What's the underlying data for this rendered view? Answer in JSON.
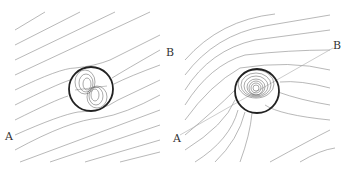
{
  "figure": {
    "panels": [
      {
        "id": "left",
        "labels": {
          "A": "A",
          "B": "B"
        },
        "circle": {
          "cx": 91,
          "cy": 89,
          "r": 22
        },
        "description": "Uniform diagonal field lines deflected around a circular inclusion with dipole-like contours inside"
      },
      {
        "id": "right",
        "labels": {
          "A": "A",
          "B": "B"
        },
        "circle": {
          "cx": 257,
          "cy": 91,
          "r": 22
        },
        "description": "Curved field lines wrapping around circular inclusion with concentric contours inside; dashed line from A to B"
      }
    ],
    "colors": {
      "lines": "#777777",
      "circle": "#222222",
      "text": "#333333"
    }
  }
}
